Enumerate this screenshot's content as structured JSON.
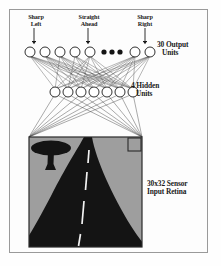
{
  "figure": {
    "background_color": "#fefefe",
    "frame_color": "#9a9a9a"
  },
  "labels": {
    "sharp_left": "Sharp\nLeft",
    "straight_ahead": "Straight\nAhead",
    "sharp_right": "Sharp\nRight",
    "output_units": "30 Output",
    "output_units_line2": "Units",
    "hidden_units": "4 Hidden",
    "hidden_units_line2": "Units",
    "sensor_retina": "30x32 Sensor",
    "sensor_retina_line2": "Input Retina"
  },
  "network": {
    "output_layer": {
      "name": "output-unit-row",
      "count_drawn": 7,
      "declared_count": 30,
      "radius": 5.0,
      "cy": 52,
      "cx": [
        30,
        45,
        60,
        75,
        90,
        135,
        150
      ],
      "ellipsis_dots_cx": [
        104,
        112,
        120
      ],
      "ellipsis_dots_cy": 52,
      "ellipsis_dot_r": 2.6,
      "fill": "#ffffff",
      "stroke": "#1a1a1a"
    },
    "hidden_layer": {
      "name": "hidden-unit-row",
      "count_drawn": 7,
      "declared_count": 4,
      "radius": 5.0,
      "cy": 92,
      "cx": [
        55,
        68,
        81,
        94,
        107,
        120,
        133
      ],
      "fill": "#ffffff",
      "stroke": "#1a1a1a"
    },
    "arrows": {
      "name": "direction-arrows",
      "y_top": 28,
      "y_bottom": 43,
      "x": [
        34,
        88,
        145
      ]
    },
    "connection_color": "#3b3b3b"
  },
  "retina": {
    "name": "sensor-input-retina",
    "x": 29,
    "y": 137,
    "width": 113,
    "height": 110,
    "grid_rows": 30,
    "grid_cols": 32,
    "sky_color": "#9e9e9e",
    "road_color": "#141414",
    "lane_marking_color": "#f2f2f2",
    "border_color": "#2a2a2a",
    "corner_pixel_marker": {
      "name": "corner-pixel-marker",
      "x": 128,
      "y": 138,
      "size": 13
    },
    "tree": {
      "name": "roadside-tree",
      "canopy_cx": 51,
      "canopy_cy": 148,
      "canopy_rx": 20,
      "canopy_ry": 7,
      "trunk_x": 47,
      "trunk_y": 150,
      "trunk_w": 6,
      "trunk_h": 21
    },
    "lane_dashes": [
      {
        "x1": 89.0,
        "y1": 150,
        "x2": 88.0,
        "y2": 163
      },
      {
        "x1": 87.0,
        "y1": 172,
        "x2": 85.5,
        "y2": 190
      },
      {
        "x1": 84.0,
        "y1": 201,
        "x2": 82.0,
        "y2": 224
      },
      {
        "x1": 80.5,
        "y1": 234,
        "x2": 78.5,
        "y2": 246
      }
    ]
  }
}
